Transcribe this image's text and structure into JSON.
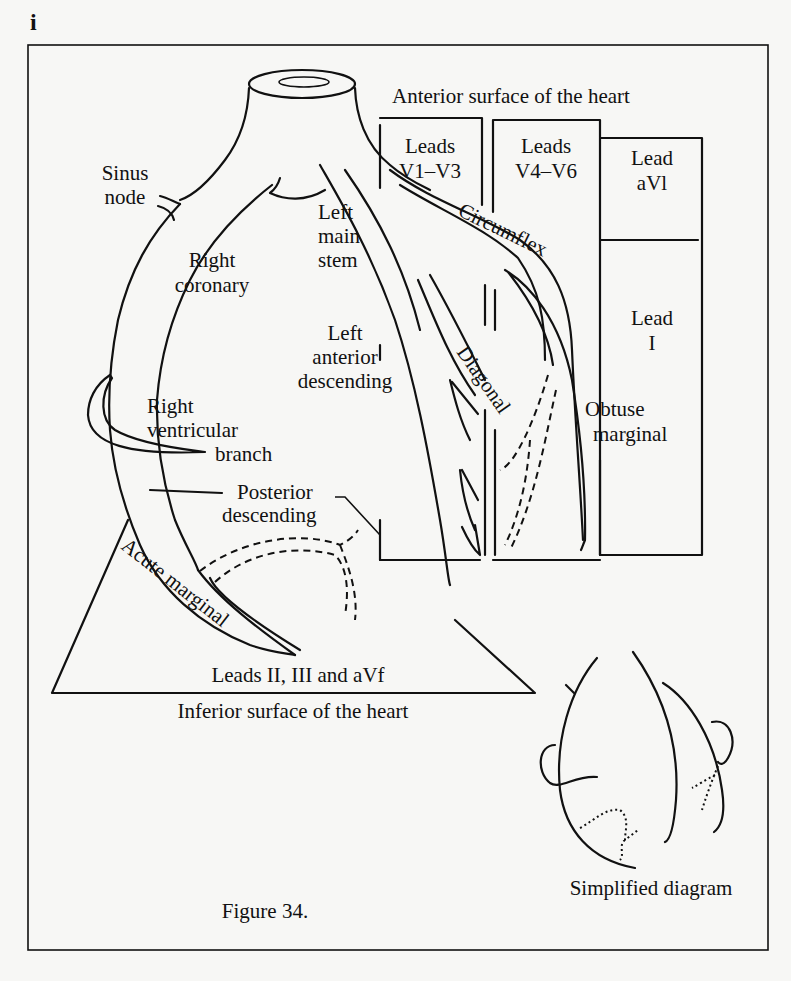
{
  "page": {
    "section_marker": "i",
    "caption": "Figure 34."
  },
  "figure": {
    "surfaces": {
      "anterior": "Anterior surface of the heart",
      "inferior": "Inferior surface of the heart"
    },
    "lead_groups": {
      "v1_v3": {
        "line1": "Leads",
        "line2": "V1–V3"
      },
      "v4_v6": {
        "line1": "Leads",
        "line2": "V4–V6"
      },
      "avl": {
        "line1": "Lead",
        "line2": "aVl"
      },
      "lead_i": {
        "line1": "Lead",
        "line2": "I"
      },
      "inferior_leads": "Leads II, III and aVf"
    },
    "vessels": {
      "sinus_node": {
        "line1": "Sinus",
        "line2": "node"
      },
      "left_main_stem": {
        "line1": "Left",
        "line2": "main",
        "line3": "stem"
      },
      "right_coronary": {
        "line1": "Right",
        "line2": "coronary"
      },
      "circumflex": "Circumflex",
      "diagonal": "Diagonal",
      "lad": {
        "line1": "Left",
        "line2": "anterior",
        "line3": "descending"
      },
      "obtuse_marginal": {
        "line1": "Obtuse",
        "line2": "marginal"
      },
      "rv_branch": {
        "line1": "Right",
        "line2": "ventricular",
        "line3": "branch"
      },
      "posterior_descending": {
        "line1": "Posterior",
        "line2": "descending"
      },
      "acute_marginal": "Acute marginal"
    },
    "inset_label": "Simplified diagram"
  }
}
